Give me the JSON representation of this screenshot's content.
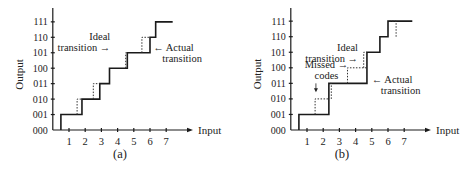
{
  "figure": {
    "panels": [
      {
        "caption": "(a)",
        "ylabel": "Output",
        "xlabel": "Input",
        "y_ticks": [
          "000",
          "001",
          "010",
          "011",
          "100",
          "101",
          "110",
          "111"
        ],
        "x_ticks": [
          "1",
          "2",
          "3",
          "4",
          "5",
          "6",
          "7"
        ],
        "annotations": [
          {
            "text": [
              "Ideal",
              "transition →"
            ],
            "x": 3.55,
            "y": 5.85,
            "anchor": "end"
          },
          {
            "text": [
              "← Actual",
              "transition"
            ],
            "x": 6.2,
            "y": 5.1,
            "anchor": "start"
          }
        ]
      },
      {
        "caption": "(b)",
        "ylabel": "Output",
        "xlabel": "Input",
        "y_ticks": [
          "000",
          "001",
          "010",
          "011",
          "100",
          "101",
          "110",
          "111"
        ],
        "x_ticks": [
          "1",
          "2",
          "3",
          "4",
          "5",
          "6",
          "7"
        ],
        "annotations": [
          {
            "text": [
              "Ideal",
              "transition →"
            ],
            "x": 4.15,
            "y": 5.05,
            "anchor": "end"
          },
          {
            "text": [
              "Missed →",
              "codes"
            ],
            "x": 2.2,
            "y": 4.0,
            "anchor": "middle"
          },
          {
            "text": [
              "← Actual",
              "transition"
            ],
            "x": 5.0,
            "y": 3.0,
            "anchor": "start"
          }
        ]
      }
    ]
  },
  "chart_data": [
    {
      "type": "line",
      "title": "(a)",
      "xlabel": "Input",
      "ylabel": "Output",
      "x_ticks": [
        1,
        2,
        3,
        4,
        5,
        6,
        7
      ],
      "y_ticks": [
        "000",
        "001",
        "010",
        "011",
        "100",
        "101",
        "110",
        "111"
      ],
      "series": [
        {
          "name": "Actual transition",
          "style": "solid",
          "steps": [
            [
              0.5,
              1
            ],
            [
              1.8,
              2
            ],
            [
              2.9,
              3
            ],
            [
              3.5,
              4
            ],
            [
              4.6,
              5
            ],
            [
              6.0,
              6
            ],
            [
              6.35,
              7
            ]
          ],
          "x_end": 7.4
        },
        {
          "name": "Ideal transition",
          "style": "dotted",
          "steps": [
            [
              1.5,
              2
            ],
            [
              2.5,
              3
            ],
            [
              4.5,
              5
            ],
            [
              5.5,
              6
            ]
          ]
        }
      ]
    },
    {
      "type": "line",
      "title": "(b)",
      "xlabel": "Input",
      "ylabel": "Output",
      "x_ticks": [
        1,
        2,
        3,
        4,
        5,
        6,
        7
      ],
      "y_ticks": [
        "000",
        "001",
        "010",
        "011",
        "100",
        "101",
        "110",
        "111"
      ],
      "series": [
        {
          "name": "Actual transition",
          "style": "solid",
          "steps": [
            [
              0.5,
              1
            ],
            [
              2.35,
              3
            ],
            [
              4.7,
              5
            ],
            [
              5.5,
              6
            ],
            [
              6.0,
              7
            ]
          ],
          "x_end": 7.5
        },
        {
          "name": "Ideal transition",
          "style": "dotted",
          "steps": [
            [
              1.5,
              2
            ],
            [
              2.5,
              3
            ],
            [
              3.5,
              4
            ],
            [
              4.5,
              5
            ],
            [
              6.5,
              7
            ]
          ]
        }
      ],
      "annotations": [
        "Missed codes",
        "Ideal transition",
        "Actual transition"
      ]
    }
  ]
}
